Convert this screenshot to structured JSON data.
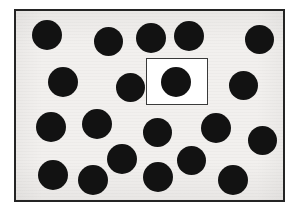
{
  "figure": {
    "canvas": {
      "width": 298,
      "height": 216,
      "background": "#ffffff"
    },
    "panel": {
      "x": 14,
      "y": 9,
      "width": 271,
      "height": 193,
      "background": "#f2f0ee",
      "border_color": "#242424",
      "border_width": 2
    },
    "highlight_box": {
      "label": "highlight-rectangle",
      "x": 146,
      "y": 58,
      "width": 62,
      "height": 47,
      "fill": "#ffffff",
      "border_color": "#3a3a3a",
      "border_width": 1.5
    },
    "dot_style": {
      "fill": "#121212",
      "default_diameter": 29
    },
    "counts": {
      "total_dots": 22,
      "dots_inside_highlight": 1,
      "dots_outside_highlight": 21
    },
    "dots": [
      {
        "id": "dot-1",
        "row": 1,
        "cx": 47,
        "cy": 35,
        "d": 30,
        "in_highlight": false
      },
      {
        "id": "dot-2",
        "row": 1,
        "cx": 108,
        "cy": 41,
        "d": 29,
        "in_highlight": false
      },
      {
        "id": "dot-3",
        "row": 1,
        "cx": 151,
        "cy": 38,
        "d": 30,
        "in_highlight": false
      },
      {
        "id": "dot-4",
        "row": 1,
        "cx": 189,
        "cy": 36,
        "d": 30,
        "in_highlight": false
      },
      {
        "id": "dot-5",
        "row": 1,
        "cx": 259,
        "cy": 39,
        "d": 29,
        "in_highlight": false
      },
      {
        "id": "dot-6",
        "row": 2,
        "cx": 63,
        "cy": 82,
        "d": 30,
        "in_highlight": false
      },
      {
        "id": "dot-7",
        "row": 2,
        "cx": 130,
        "cy": 87,
        "d": 29,
        "in_highlight": false
      },
      {
        "id": "dot-8",
        "row": 2,
        "cx": 176,
        "cy": 82,
        "d": 30,
        "in_highlight": true
      },
      {
        "id": "dot-9",
        "row": 2,
        "cx": 243,
        "cy": 85,
        "d": 29,
        "in_highlight": false
      },
      {
        "id": "dot-10",
        "row": 3,
        "cx": 51,
        "cy": 127,
        "d": 30,
        "in_highlight": false
      },
      {
        "id": "dot-11",
        "row": 3,
        "cx": 97,
        "cy": 124,
        "d": 30,
        "in_highlight": false
      },
      {
        "id": "dot-12",
        "row": 3,
        "cx": 157,
        "cy": 132,
        "d": 29,
        "in_highlight": false
      },
      {
        "id": "dot-13",
        "row": 3,
        "cx": 216,
        "cy": 128,
        "d": 30,
        "in_highlight": false
      },
      {
        "id": "dot-14",
        "row": 3,
        "cx": 262,
        "cy": 140,
        "d": 29,
        "in_highlight": false
      },
      {
        "id": "dot-15",
        "row": 4,
        "cx": 122,
        "cy": 159,
        "d": 30,
        "in_highlight": false
      },
      {
        "id": "dot-16",
        "row": 4,
        "cx": 191,
        "cy": 160,
        "d": 29,
        "in_highlight": false
      },
      {
        "id": "dot-17",
        "row": 4,
        "cx": 53,
        "cy": 175,
        "d": 30,
        "in_highlight": false
      },
      {
        "id": "dot-18",
        "row": 4,
        "cx": 93,
        "cy": 180,
        "d": 30,
        "in_highlight": false
      },
      {
        "id": "dot-19",
        "row": 4,
        "cx": 158,
        "cy": 177,
        "d": 30,
        "in_highlight": false
      },
      {
        "id": "dot-20",
        "row": 4,
        "cx": 233,
        "cy": 180,
        "d": 30,
        "in_highlight": false
      }
    ]
  }
}
